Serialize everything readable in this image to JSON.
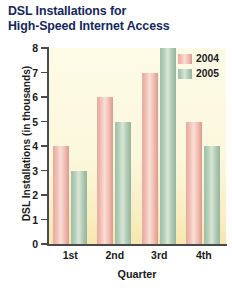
{
  "chart_data": {
    "type": "bar",
    "title": "DSL Installations for High-Speed Internet Access",
    "title_line1": "DSL Installations for",
    "title_line2": "High-Speed Internet Access",
    "xlabel": "Quarter",
    "ylabel": "DSL Installations (in thousands)",
    "categories": [
      "1st",
      "2nd",
      "3rd",
      "4th"
    ],
    "series": [
      {
        "name": "2004",
        "values": [
          4,
          6,
          7,
          5
        ],
        "color": "#eeb3a8"
      },
      {
        "name": "2005",
        "values": [
          3,
          5,
          8,
          4
        ],
        "color": "#a9c9b4"
      }
    ],
    "ylim": [
      0,
      8
    ],
    "yticks": [
      "0",
      "1",
      "2",
      "3",
      "4",
      "5",
      "6",
      "7",
      "8"
    ],
    "grid": false,
    "legend_position": "top-right"
  },
  "legend": {
    "items": [
      {
        "label": "2004"
      },
      {
        "label": "2005"
      }
    ]
  },
  "colors": {
    "title_text": "#16265c",
    "axis": "#4a4a4a",
    "plot_background": "#fcf8dd",
    "page_background": "#ffffff"
  }
}
